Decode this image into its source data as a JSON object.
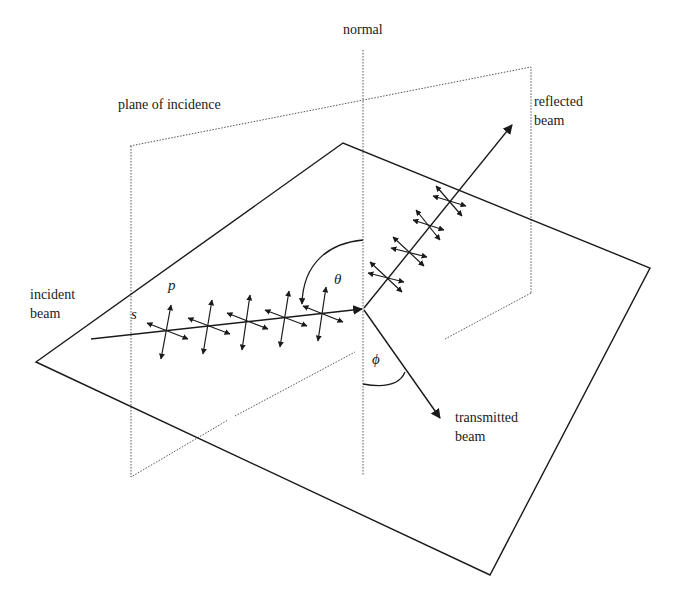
{
  "diagram": {
    "type": "optics-reflection-refraction",
    "labels": {
      "normal": "normal",
      "plane_of_incidence": "plane of incidence",
      "reflected_line1": "reflected",
      "reflected_line2": "beam",
      "incident_line1": "incident",
      "incident_line2": "beam",
      "transmitted_line1": "transmitted",
      "transmitted_line2": "beam",
      "p": "p",
      "s": "s",
      "theta": "θ",
      "phi": "ϕ"
    },
    "colors": {
      "line": "#1a1a1a",
      "dotted": "#555555",
      "background": "#ffffff"
    },
    "elements": [
      "interface surface (solid quadrilateral)",
      "plane of incidence (dotted rectangle)",
      "normal (dotted vertical line)",
      "incident beam with p and s polarization arrows",
      "reflected beam with polarization arrows",
      "transmitted beam",
      "angle of incidence theta arc",
      "angle of refraction phi arc"
    ]
  }
}
